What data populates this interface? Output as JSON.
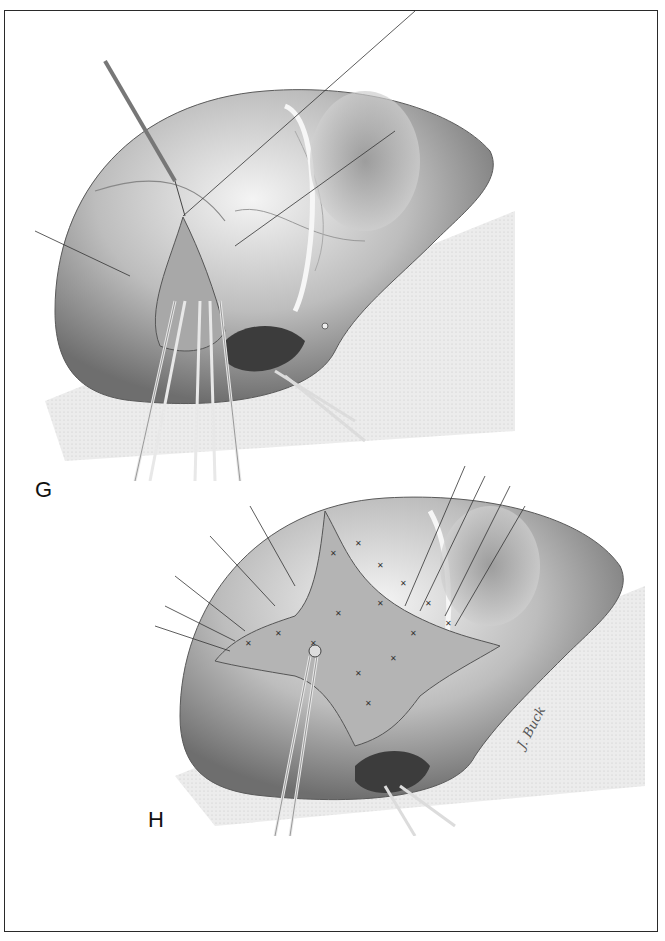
{
  "figure": {
    "panels": [
      {
        "id": "G",
        "label": "G",
        "description": "Liver surgery illustration: wedge of parenchyma elevated with sutures and clamps"
      },
      {
        "id": "H",
        "label": "H",
        "description": "Liver surgery illustration: star-shaped sutured defect with retention sutures"
      }
    ],
    "signature": "J. Buck",
    "colors": {
      "border": "#2a2a2a",
      "background": "#ffffff",
      "ink": "#111111"
    }
  }
}
